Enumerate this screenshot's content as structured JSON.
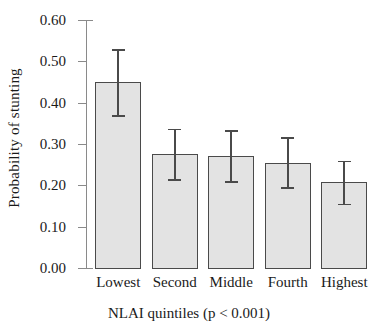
{
  "chart_data": {
    "type": "bar",
    "title": "",
    "xlabel": "NLAI quintiles (p < 0.001)",
    "ylabel": "Probability of stunting",
    "categories": [
      "Lowest",
      "Second",
      "Middle",
      "Fourth",
      "Highest"
    ],
    "values": [
      0.45,
      0.275,
      0.27,
      0.255,
      0.208
    ],
    "error_low": [
      0.37,
      0.215,
      0.21,
      0.196,
      0.156
    ],
    "error_high": [
      0.53,
      0.337,
      0.333,
      0.316,
      0.26
    ],
    "ylim": [
      0.0,
      0.6
    ],
    "yticks": [
      0.0,
      0.1,
      0.2,
      0.3,
      0.4,
      0.5,
      0.6
    ],
    "ytick_labels": [
      "0.00",
      "0.10",
      "0.20",
      "0.30",
      "0.40",
      "0.50",
      "0.60"
    ],
    "grid": false,
    "legend": null,
    "series": [
      {
        "name": "Probability of stunting",
        "values": [
          0.45,
          0.275,
          0.27,
          0.255,
          0.208
        ]
      }
    ],
    "bar_fill_color": "#e3e3e3",
    "bar_edge_color": "#4a4a4a",
    "error_bar_color": "#4a4a4a",
    "axis_color": "#8a8a8a",
    "background_color": "#ffffff"
  }
}
